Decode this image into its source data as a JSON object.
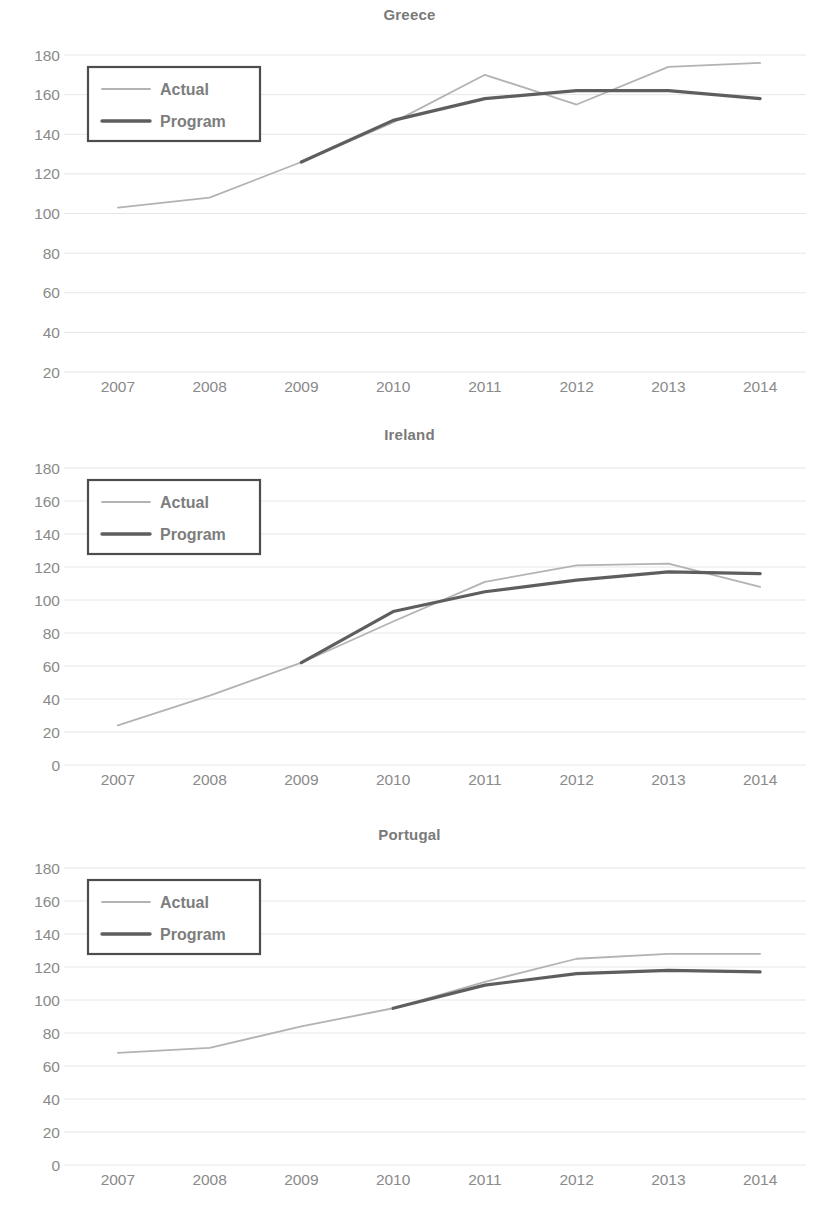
{
  "legend": {
    "actual_label": "Actual",
    "program_label": "Program"
  },
  "colors": {
    "actual": "#b3b3b3",
    "program": "#5e5e5e",
    "gridline": "#e6e6e6",
    "text": "#8a8a8a",
    "legend_border": "#4d4d4d",
    "background": "#ffffff"
  },
  "chart_data": [
    {
      "type": "line",
      "title": "Greece",
      "xlabel": "",
      "ylabel": "",
      "categories": [
        "2007",
        "2008",
        "2009",
        "2010",
        "2011",
        "2012",
        "2013",
        "2014"
      ],
      "x": [
        2007,
        2008,
        2009,
        2010,
        2011,
        2012,
        2013,
        2014
      ],
      "ylim": [
        20,
        180
      ],
      "ytick_step": 20,
      "yticks": [
        20,
        40,
        60,
        80,
        100,
        120,
        140,
        160,
        180
      ],
      "grid": true,
      "legend_position": "top-left",
      "series": [
        {
          "name": "Actual",
          "values": [
            103,
            108,
            126,
            146,
            170,
            155,
            174,
            176
          ],
          "color": "#b3b3b3"
        },
        {
          "name": "Program",
          "values": [
            null,
            null,
            126,
            147,
            158,
            162,
            162,
            158
          ],
          "color": "#5e5e5e"
        }
      ]
    },
    {
      "type": "line",
      "title": "Ireland",
      "xlabel": "",
      "ylabel": "",
      "categories": [
        "2007",
        "2008",
        "2009",
        "2010",
        "2011",
        "2012",
        "2013",
        "2014"
      ],
      "x": [
        2007,
        2008,
        2009,
        2010,
        2011,
        2012,
        2013,
        2014
      ],
      "ylim": [
        0,
        180
      ],
      "ytick_step": 20,
      "yticks": [
        0,
        20,
        40,
        60,
        80,
        100,
        120,
        140,
        160,
        180
      ],
      "grid": true,
      "legend_position": "top-left",
      "series": [
        {
          "name": "Actual",
          "values": [
            24,
            42,
            62,
            87,
            111,
            121,
            122,
            108
          ],
          "color": "#b3b3b3"
        },
        {
          "name": "Program",
          "values": [
            null,
            null,
            62,
            93,
            105,
            112,
            117,
            116
          ],
          "color": "#5e5e5e"
        }
      ]
    },
    {
      "type": "line",
      "title": "Portugal",
      "xlabel": "",
      "ylabel": "",
      "categories": [
        "2007",
        "2008",
        "2009",
        "2010",
        "2011",
        "2012",
        "2013",
        "2014"
      ],
      "x": [
        2007,
        2008,
        2009,
        2010,
        2011,
        2012,
        2013,
        2014
      ],
      "ylim": [
        0,
        180
      ],
      "ytick_step": 20,
      "yticks": [
        0,
        20,
        40,
        60,
        80,
        100,
        120,
        140,
        160,
        180
      ],
      "grid": true,
      "legend_position": "top-left",
      "series": [
        {
          "name": "Actual",
          "values": [
            68,
            71,
            84,
            95,
            111,
            125,
            128,
            128
          ],
          "color": "#b3b3b3"
        },
        {
          "name": "Program",
          "values": [
            null,
            null,
            null,
            95,
            109,
            116,
            118,
            117
          ],
          "color": "#5e5e5e"
        }
      ]
    }
  ]
}
